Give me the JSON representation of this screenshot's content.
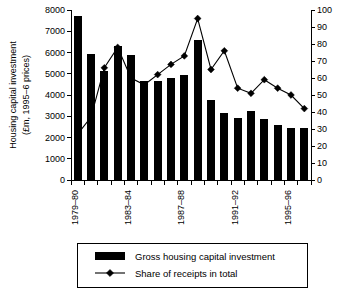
{
  "chart_data": {
    "type": "bar",
    "title": "",
    "xlabel": "",
    "ylabel": "Housing capital investment",
    "ylabel_line2": "(£m, 1995–6 prices)",
    "y2label": "",
    "ylim": [
      0,
      8000
    ],
    "y2lim": [
      0,
      100
    ],
    "yticks": [
      0,
      1000,
      2000,
      3000,
      4000,
      5000,
      6000,
      7000,
      8000
    ],
    "y2ticks": [
      0,
      10,
      20,
      30,
      40,
      50,
      60,
      70,
      80,
      90,
      100
    ],
    "grid": false,
    "legend_position": "bottom",
    "categories": [
      "1979–80",
      "1980–81",
      "1981–82",
      "1982–83",
      "1983–84",
      "1984–85",
      "1985–86",
      "1986–87",
      "1987–88",
      "1988–89",
      "1989–90",
      "1990–91",
      "1991–92",
      "1992–93",
      "1993–94",
      "1994–95",
      "1995–96",
      "1996–97"
    ],
    "xtick_labels": [
      "1979–80",
      "1983–84",
      "1987–88",
      "1991–92",
      "1995–96"
    ],
    "xtick_indices": [
      0,
      4,
      8,
      12,
      16
    ],
    "series": [
      {
        "name": "Gross housing capital investment",
        "type": "bar",
        "axis": "left",
        "color": "#000000",
        "values": [
          7700,
          5950,
          5150,
          6300,
          5900,
          4650,
          4680,
          4800,
          4960,
          6570,
          3760,
          3140,
          2940,
          3230,
          2850,
          2570,
          2430,
          2430
        ]
      },
      {
        "name": "Share of receipts in total",
        "type": "line",
        "axis": "right",
        "color": "#000000",
        "marker": "diamond",
        "values": [
          27,
          37,
          66,
          78,
          60,
          56,
          62,
          68,
          73,
          95,
          65,
          76,
          54,
          51,
          59,
          54,
          50,
          42
        ]
      }
    ]
  },
  "legend": {
    "items": [
      {
        "label": "Gross housing capital investment",
        "marker": "bar-swatch"
      },
      {
        "label": "Share of receipts in total",
        "marker": "line-diamond-swatch"
      }
    ]
  }
}
